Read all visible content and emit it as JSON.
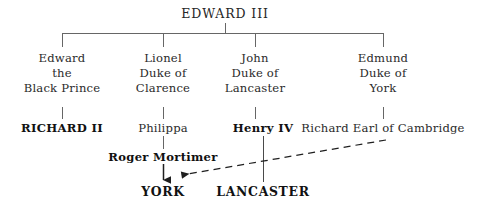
{
  "diagram": {
    "title": "EDWARD III",
    "type": "genealogical-family-tree",
    "line_color": "#555555",
    "text_color": "#2a2a2a",
    "background_color": "#ffffff",
    "root": {
      "label": "EDWARD III",
      "style": "caps"
    },
    "children": [
      {
        "id": "edward-black-prince",
        "lines": [
          "Edward",
          "the",
          "Black Prince"
        ],
        "line1": "Edward",
        "line2": "the",
        "line3": "Black Prince",
        "heir": {
          "label": "RICHARD II",
          "style": "bold"
        }
      },
      {
        "id": "lionel-clarence",
        "lines": [
          "Lionel",
          "Duke of",
          "Clarence"
        ],
        "line1": "Lionel",
        "line2": "Duke of",
        "line3": "Clarence",
        "heir": {
          "label": "Philippa",
          "style": "regular"
        },
        "grandchild": {
          "label": "Roger Mortimer",
          "style": "bold"
        }
      },
      {
        "id": "john-lancaster",
        "lines": [
          "John",
          "Duke of",
          "Lancaster"
        ],
        "line1": "John",
        "line2": "Duke of",
        "line3": "Lancaster",
        "heir": {
          "label": "Henry IV",
          "style": "bold"
        }
      },
      {
        "id": "edmund-york",
        "lines": [
          "Edmund",
          "Duke of",
          "York"
        ],
        "line1": "Edmund",
        "line2": "Duke of",
        "line3": "York",
        "heir": {
          "label": "Richard Earl of Cambridge",
          "style": "regular"
        }
      }
    ],
    "houses": [
      {
        "id": "house-york",
        "label": "YORK"
      },
      {
        "id": "house-lancaster",
        "label": "LANCASTER"
      }
    ],
    "connectors": {
      "solid_arrow_note": "Roger Mortimer to YORK",
      "dashed_arrow_note": "Richard Earl of Cambridge to YORK",
      "lancaster_line_note": "Henry IV to LANCASTER"
    }
  }
}
